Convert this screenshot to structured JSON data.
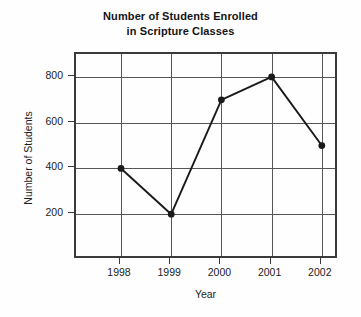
{
  "chart_data": {
    "type": "line",
    "title": "Number of Students Enrolled in Scripture Classes",
    "title_line1": "Number of Students Enrolled",
    "title_line2": "in Scripture Classes",
    "xlabel": "Year",
    "ylabel": "Number of Students",
    "categories": [
      "1998",
      "1999",
      "2000",
      "2001",
      "2002"
    ],
    "values": [
      400,
      200,
      700,
      800,
      500
    ],
    "series": [
      {
        "name": "Number of Students",
        "values": [
          400,
          200,
          700,
          800,
          500
        ]
      }
    ],
    "points": [
      {
        "x": "1998",
        "y": 400
      },
      {
        "x": "1999",
        "y": 200
      },
      {
        "x": "2000",
        "y": 700
      },
      {
        "x": "2001",
        "y": 800
      },
      {
        "x": "2002",
        "y": 500
      }
    ],
    "ylim": [
      0,
      900
    ],
    "yticks": [
      200,
      400,
      600,
      800
    ],
    "ytick_labels": [
      "200",
      "400",
      "600",
      "800"
    ],
    "xticks": [
      "1998",
      "1999",
      "2000",
      "2001",
      "2002"
    ],
    "grid": true,
    "grid_axes": "both",
    "legend": false,
    "legend_position": "none",
    "marker": "filled-circle",
    "line_color": "#1a1a1a",
    "marker_color": "#1a1a1a",
    "grid_color": "#565656",
    "axis_color": "#3b3b3b",
    "background_color": "#fefefe",
    "text_color": "#1c1c1c"
  }
}
